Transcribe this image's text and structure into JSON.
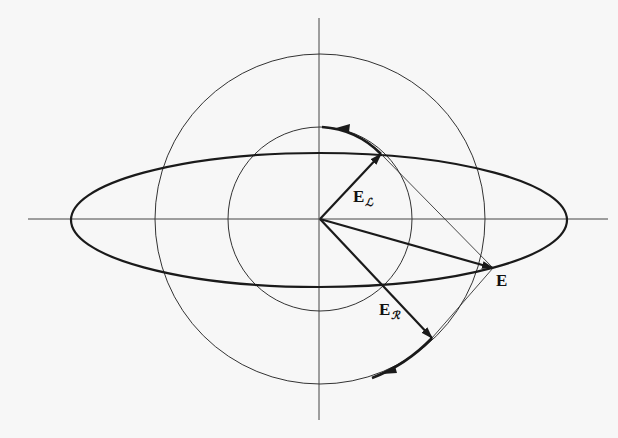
{
  "diagram": {
    "title": "",
    "colors": {
      "background": "#f7f7f7",
      "stroke": "#1a1a1a",
      "thin_stroke": "#333333"
    },
    "origin": [
      320,
      219
    ],
    "axes": {
      "horizontal": {
        "x1": 28,
        "x2": 608,
        "y": 219
      },
      "vertical": {
        "x": 319,
        "y1": 18,
        "y2": 420
      }
    },
    "circles": [
      {
        "name": "inner-circle",
        "r": 92
      },
      {
        "name": "outer-circle",
        "r": 165
      }
    ],
    "ellipse": {
      "rx": 248,
      "ry": 67
    },
    "vectors": [
      {
        "name": "E_L",
        "tip": [
          381,
          154
        ]
      },
      {
        "name": "E_R",
        "tip": [
          432,
          338
        ]
      },
      {
        "name": "E",
        "tip": [
          493,
          268
        ]
      }
    ],
    "labels": {
      "e_left": {
        "main": "E",
        "sub": "ℒ"
      },
      "e_right": {
        "main": "E",
        "sub": "ℛ"
      },
      "e_total": {
        "main": "E"
      }
    }
  }
}
